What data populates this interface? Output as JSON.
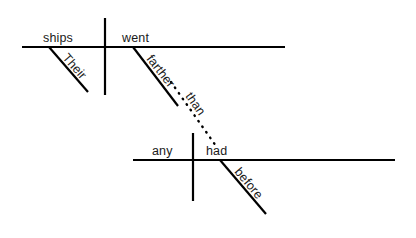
{
  "diagram": {
    "type": "reed-kellogg-sentence-diagram",
    "sentence": "Their ships went farther than any had before.",
    "colors": {
      "background": "#ffffff",
      "line": "#000000",
      "text": "#1a1a1a"
    },
    "main_clause": {
      "subject": "ships",
      "predicate": "went",
      "modifiers": [
        {
          "word": "Their",
          "attaches_to": "ships"
        },
        {
          "word": "farther",
          "attaches_to": "went"
        }
      ]
    },
    "subordinate_clause": {
      "subject": "any",
      "predicate": "had",
      "modifiers": [
        {
          "word": "before",
          "attaches_to": "had"
        }
      ]
    },
    "connector": {
      "word": "than",
      "style": "dotted",
      "from": "farther",
      "to": "had"
    },
    "labels": {
      "their": "Their",
      "ships": "ships",
      "went": "went",
      "farther": "farther",
      "than": "than",
      "any": "any",
      "had": "had",
      "before": "before"
    }
  }
}
